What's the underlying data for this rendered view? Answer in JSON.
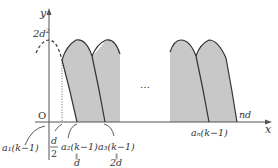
{
  "axes": {
    "x_label": "x",
    "y_label": "y",
    "origin_label": "O"
  },
  "y_tick": {
    "label_base": "2d",
    "label_sup": "2"
  },
  "ellipsis": "…",
  "labels": {
    "a1": "a₁(k−1)",
    "half_num": "d",
    "half_den": "2",
    "a2": "a₂(k−1)",
    "a2_eq": "‖",
    "a2_val": "d",
    "a3": "a₃(k−1)",
    "a3_eq": "‖",
    "a3_val": "2d",
    "an": "aₙ(k−1)",
    "nd": "nd"
  },
  "colors": {
    "fill": "#c8c8c8",
    "line": "#333333",
    "axis": "#555555"
  }
}
